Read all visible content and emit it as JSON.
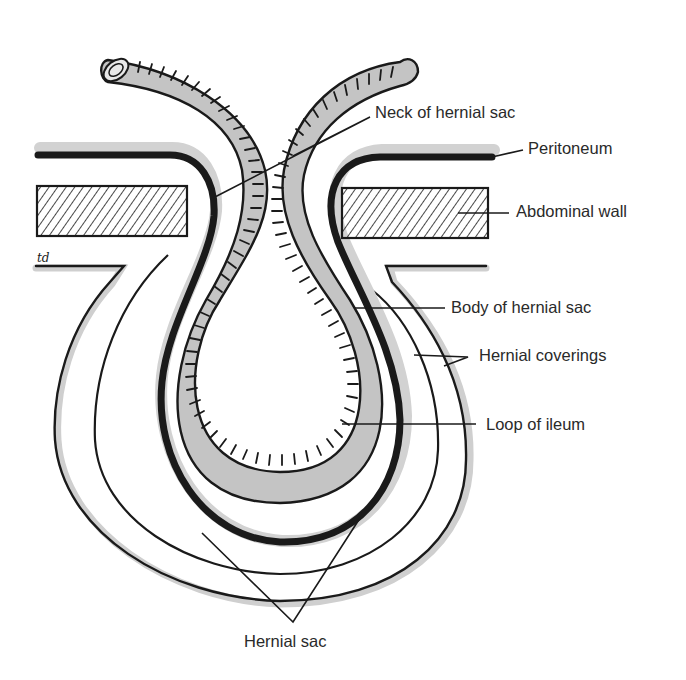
{
  "diagram": {
    "type": "anatomical-illustration",
    "signature": "td",
    "labels": {
      "neck_of_hernial_sac": "Neck of hernial sac",
      "peritoneum": "Peritoneum",
      "abdominal_wall": "Abdominal wall",
      "body_of_hernial_sac": "Body of hernial sac",
      "hernial_coverings": "Hernial coverings",
      "loop_of_ileum": "Loop of ileum",
      "hernial_sac": "Hernial sac"
    },
    "colors": {
      "line": "#1a1a1a",
      "intestine_fill": "#c4c4c4",
      "shadow": "#cfcfcf",
      "background": "#ffffff",
      "text": "#2a2a2a"
    }
  }
}
